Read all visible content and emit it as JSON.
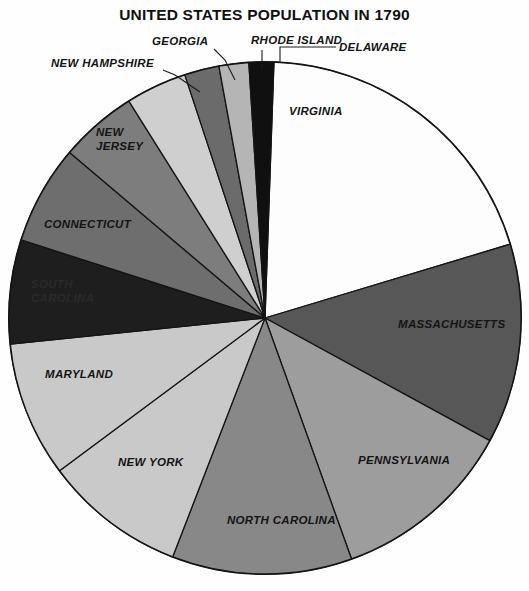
{
  "chart_data": {
    "type": "pie",
    "title": "UNITED STATES POPULATION IN 1790",
    "xlabel": "",
    "ylabel": "",
    "legend_position": "none",
    "grid": false,
    "start_angle_deg": 2,
    "direction": "clockwise",
    "center": {
      "x": 265,
      "y": 318
    },
    "radius": 256,
    "slices": [
      {
        "label": "VIRGINIA",
        "value": 19.0,
        "color": "#fdfdfd",
        "label_mode": "inside",
        "label_x": 289,
        "label_y": 115,
        "anchor": "start"
      },
      {
        "label": "MASSACHUSETTS",
        "value": 12.1,
        "color": "#575757",
        "label_mode": "inside",
        "label_x": 398,
        "label_y": 328,
        "anchor": "start"
      },
      {
        "label": "PENNSYLVANIA",
        "value": 11.1,
        "color": "#9d9d9d",
        "label_mode": "inside",
        "label_x": 358,
        "label_y": 464,
        "anchor": "start"
      },
      {
        "label": "NORTH CAROLINA",
        "value": 10.9,
        "color": "#888888",
        "label_mode": "inside",
        "label_x": 227,
        "label_y": 524,
        "anchor": "start"
      },
      {
        "label": "NEW YORK",
        "value": 8.6,
        "color": "#c9c9c9",
        "label_mode": "inside",
        "label_x": 118,
        "label_y": 466,
        "anchor": "start"
      },
      {
        "label": "MARYLAND",
        "value": 8.2,
        "color": "#c9c9c9",
        "label_mode": "inside",
        "label_x": 45,
        "label_y": 378,
        "anchor": "start"
      },
      {
        "label": "SOUTH CAROLINA",
        "value": 6.3,
        "color": "#1e1e1e",
        "label_mode": "inside2",
        "label_x": 31,
        "label_y": 288,
        "anchor": "start"
      },
      {
        "label": "CONNECTICUT",
        "value": 6.0,
        "color": "#6e6e6e",
        "label_mode": "inside",
        "label_x": 44,
        "label_y": 228,
        "anchor": "start"
      },
      {
        "label": "NEW JERSEY",
        "value": 4.7,
        "color": "#7d7d7d",
        "label_mode": "inside2",
        "label_x": 96,
        "label_y": 136,
        "anchor": "start"
      },
      {
        "label": "NEW HAMPSHIRE",
        "value": 3.7,
        "color": "#cfcfcf",
        "label_mode": "callout",
        "label_x": 51,
        "label_y": 67,
        "anchor": "start",
        "leader": [
          [
            163,
            70
          ],
          [
            175,
            75
          ],
          [
            200,
            92
          ]
        ]
      },
      {
        "label": "GEORGIA",
        "value": 2.1,
        "color": "#6b6b6b",
        "label_mode": "callout",
        "label_x": 152,
        "label_y": 45,
        "anchor": "start",
        "leader": [
          [
            214,
            49
          ],
          [
            225,
            60
          ],
          [
            235,
            80
          ]
        ]
      },
      {
        "label": "RHODE ISLAND",
        "value": 1.8,
        "color": "#b5b5b5",
        "label_mode": "callout",
        "label_x": 251,
        "label_y": 44,
        "anchor": "start",
        "leader": [
          [
            262,
            50
          ],
          [
            262,
            70
          ]
        ]
      },
      {
        "label": "DELAWARE",
        "value": 1.5,
        "color": "#101010",
        "label_mode": "callout",
        "label_x": 339,
        "label_y": 51,
        "anchor": "start",
        "leader": [
          [
            336,
            47
          ],
          [
            280,
            47
          ],
          [
            280,
            62
          ]
        ]
      }
    ]
  }
}
